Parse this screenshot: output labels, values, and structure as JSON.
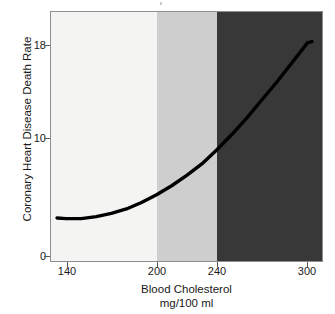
{
  "chart_data": {
    "type": "line",
    "title": "",
    "subtitle": "",
    "xlabel": "Blood Cholesterol",
    "xlabel_units": "mg/100 ml",
    "ylabel": "Coronary Heart Disease Death Rate",
    "xlim": [
      130,
      311
    ],
    "ylim": [
      0,
      19.5
    ],
    "xticks": [
      140,
      200,
      240,
      300
    ],
    "xtick_labels": [
      "140",
      "200",
      "240",
      "300"
    ],
    "yticks": [
      0,
      10,
      18
    ],
    "ytick_labels": [
      "0",
      "10",
      "18"
    ],
    "grid": false,
    "legend": "none",
    "series": [
      {
        "name": "Coronary Heart Disease Death Rate",
        "color": "#000000",
        "x": [
          134,
          140,
          150,
          160,
          170,
          180,
          190,
          200,
          210,
          220,
          230,
          240,
          250,
          260,
          270,
          280,
          290,
          300,
          303
        ],
        "y": [
          3.5,
          3.45,
          3.45,
          3.6,
          3.85,
          4.2,
          4.7,
          5.3,
          6.0,
          6.8,
          7.7,
          8.8,
          10.0,
          11.3,
          12.7,
          14.1,
          15.6,
          17.1,
          17.2
        ]
      }
    ],
    "bands": [
      {
        "name": "desirable",
        "x_start": 130,
        "x_end": 200,
        "color": "#f4f4f3"
      },
      {
        "name": "borderline-high",
        "x_start": 200,
        "x_end": 240,
        "color": "#cecece"
      },
      {
        "name": "high",
        "x_start": 240,
        "x_end": 311,
        "color": "#383838"
      }
    ]
  },
  "axes": {
    "y_ticks": [
      {
        "value": 18,
        "label": "18",
        "pixel_y": 45
      },
      {
        "value": 10,
        "label": "10",
        "pixel_y": 138
      },
      {
        "value": 0,
        "label": "0",
        "pixel_y": 256
      }
    ],
    "x_ticks": [
      {
        "value": 140,
        "label": "140",
        "pixel_x": 67
      },
      {
        "value": 200,
        "label": "200",
        "pixel_x": 157
      },
      {
        "value": 240,
        "label": "240",
        "pixel_x": 217
      },
      {
        "value": 300,
        "label": "300",
        "pixel_x": 307
      }
    ]
  },
  "colors": {
    "band_low": "#f4f4f3",
    "band_mid": "#cecece",
    "band_high": "#383838",
    "curve": "#000000",
    "frame": "#8e8e8e",
    "text": "#1a1a1a",
    "background": "#ffffff"
  }
}
